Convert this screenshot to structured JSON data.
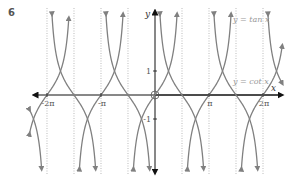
{
  "question_number": "6",
  "chart_data": {
    "type": "line",
    "title": "",
    "xlabel": "x",
    "ylabel": "y",
    "series": [
      {
        "name": "y = tan x",
        "function": "tan",
        "color": "#808080"
      },
      {
        "name": "y = cot x",
        "function": "cot",
        "color": "#808080"
      }
    ],
    "x_ticks": [
      {
        "value": -6.2832,
        "label": "-2π"
      },
      {
        "value": -3.1416,
        "label": "-π"
      },
      {
        "value": 3.1416,
        "label": "π"
      },
      {
        "value": 6.2832,
        "label": "2π"
      }
    ],
    "y_ticks": [
      {
        "value": 1,
        "label": "1"
      },
      {
        "value": -1,
        "label": "-1"
      }
    ],
    "asymptotes_x": [
      -6.2832,
      -4.7124,
      -3.1416,
      -1.5708,
      1.5708,
      3.1416,
      4.7124,
      6.2832
    ],
    "xlim": [
      -7.3,
      7.4
    ],
    "ylim": [
      -3.4,
      3.9
    ],
    "grid": false,
    "legend": "inline labels, right side",
    "origin_marker": "circle at (0,0)"
  },
  "labels": {
    "tan": "y = tan x",
    "cot": "y = cot x",
    "x_axis": "x",
    "y_axis": "y"
  },
  "layout": {
    "origin_px": [
      155,
      95
    ],
    "px_per_unit_x": 17.19,
    "px_per_unit_y": 24,
    "plot_top": 12,
    "plot_bottom": 170,
    "x_axis_left": 35,
    "x_axis_right": 281
  }
}
